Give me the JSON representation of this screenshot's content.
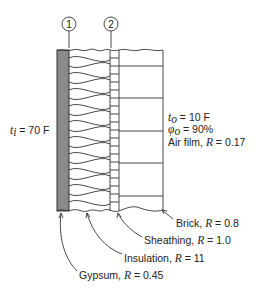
{
  "diagram": {
    "type": "wall-section",
    "markers": [
      {
        "id": "1",
        "label": "1"
      },
      {
        "id": "2",
        "label": "2"
      }
    ],
    "inside": {
      "temp_symbol": "t",
      "temp_sub": "i",
      "temp_value": " = 70 F"
    },
    "outside": {
      "temp_symbol": "t",
      "temp_sub": "o",
      "temp_value": " = 10 F",
      "rh_symbol": "φ",
      "rh_sub": "o",
      "rh_value": " = 90%",
      "airfilm_prefix": "Air film, ",
      "airfilm_R": "R",
      "airfilm_value": " = 0.17"
    },
    "layers": [
      {
        "name": "Gypsum",
        "prefix": "Gypsum, ",
        "R_symbol": "R",
        "value": " = 0.45"
      },
      {
        "name": "Insulation",
        "prefix": "Insulation, ",
        "R_symbol": "R",
        "value": " = 11"
      },
      {
        "name": "Sheathing",
        "prefix": "Sheathing, ",
        "R_symbol": "R",
        "value": " = 1.0"
      },
      {
        "name": "Brick",
        "prefix": "Brick, ",
        "R_symbol": "R",
        "value": " = 0.8"
      }
    ],
    "colors": {
      "gypsum_fill": "#8a8a8a",
      "line": "#333333"
    }
  }
}
